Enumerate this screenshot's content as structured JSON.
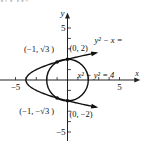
{
  "header_fragment": "y₁         y         √y₂",
  "chart_data": {
    "type": "line",
    "title": "",
    "xlabel": "x",
    "ylabel": "y",
    "xlim": [
      -6.5,
      7
    ],
    "ylim": [
      -6,
      6.5
    ],
    "x_ticks": [
      -5,
      -4,
      -3,
      -2,
      -1,
      1,
      2,
      3,
      4,
      5
    ],
    "y_ticks": [
      -5,
      -4,
      -3,
      -2,
      -1,
      1,
      2,
      3,
      4,
      5
    ],
    "x_tick_labels": [
      {
        "value": -5,
        "text": "−5"
      },
      {
        "value": 5,
        "text": "5"
      }
    ],
    "y_tick_labels": [
      {
        "value": 5,
        "text": "5"
      },
      {
        "value": -5,
        "text": "−5"
      }
    ],
    "grid": false,
    "series": [
      {
        "name": "parabola",
        "equation": "y² − x = 4",
        "label": "y² − x =",
        "kind": "parabola",
        "vertex": [
          -4,
          0
        ],
        "t_range": [
          -2.6,
          2.6
        ]
      },
      {
        "name": "circle",
        "equation": "x² + y² = 4",
        "label": "x² + y² = 4",
        "kind": "circle",
        "center": [
          0,
          0
        ],
        "radius": 2
      }
    ],
    "points": [
      {
        "x": -1,
        "y": 1.732,
        "label": "(−1, √3 )"
      },
      {
        "x": 0,
        "y": 2,
        "label": "(0, 2)"
      },
      {
        "x": -1,
        "y": -1.732,
        "label": "(−1, −√3 )"
      },
      {
        "x": 0,
        "y": -2,
        "label": "(0, −2)"
      }
    ]
  }
}
